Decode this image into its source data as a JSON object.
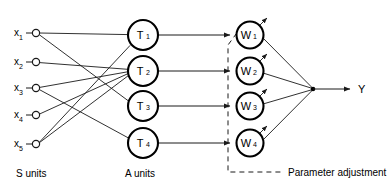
{
  "diagram": {
    "colors": {
      "line": "#1a1a1a",
      "node_stroke": "#000000",
      "background": "#ffffff"
    },
    "input_layer": {
      "caption": "S units",
      "nodes": [
        {
          "base": "x",
          "sub": "1",
          "cx": 36,
          "cy": 33
        },
        {
          "base": "x",
          "sub": "2",
          "cx": 36,
          "cy": 62
        },
        {
          "base": "x",
          "sub": "3",
          "cx": 36,
          "cy": 88
        },
        {
          "base": "x",
          "sub": "4",
          "cx": 36,
          "cy": 115
        },
        {
          "base": "x",
          "sub": "5",
          "cx": 36,
          "cy": 144
        }
      ]
    },
    "association_layer": {
      "caption": "A units",
      "nodes": [
        {
          "base": "T",
          "sub": "1",
          "cx": 143,
          "cy": 35
        },
        {
          "base": "T",
          "sub": "2",
          "cx": 143,
          "cy": 71
        },
        {
          "base": "T",
          "sub": "3",
          "cx": 143,
          "cy": 106
        },
        {
          "base": "T",
          "sub": "4",
          "cx": 143,
          "cy": 143
        }
      ]
    },
    "weight_layer": {
      "caption": "Parameter adjustment",
      "nodes": [
        {
          "base": "W",
          "sub": "1",
          "cx": 250,
          "cy": 35
        },
        {
          "base": "W",
          "sub": "2",
          "cx": 250,
          "cy": 71
        },
        {
          "base": "W",
          "sub": "3",
          "cx": 250,
          "cy": 106
        },
        {
          "base": "W",
          "sub": "4",
          "cx": 250,
          "cy": 143
        }
      ]
    },
    "output": {
      "label": "Y",
      "junction_x": 313,
      "junction_y": 89
    },
    "connections_s_to_a": [
      {
        "from": "x1",
        "to": "T1"
      },
      {
        "from": "x1",
        "to": "T3"
      },
      {
        "from": "x2",
        "to": "T2"
      },
      {
        "from": "x3",
        "to": "T2"
      },
      {
        "from": "x3",
        "to": "T4"
      },
      {
        "from": "x4",
        "to": "T2"
      },
      {
        "from": "x5",
        "to": "T1"
      },
      {
        "from": "x5",
        "to": "T2"
      }
    ],
    "connections_a_to_w": [
      {
        "from": "T1",
        "to": "W1"
      },
      {
        "from": "T2",
        "to": "W2"
      },
      {
        "from": "T3",
        "to": "W3"
      },
      {
        "from": "T4",
        "to": "W4"
      }
    ],
    "connections_w_to_output": [
      {
        "from": "W1",
        "to": "Y"
      },
      {
        "from": "W2",
        "to": "Y"
      },
      {
        "from": "W3",
        "to": "Y"
      },
      {
        "from": "W4",
        "to": "Y"
      }
    ]
  }
}
